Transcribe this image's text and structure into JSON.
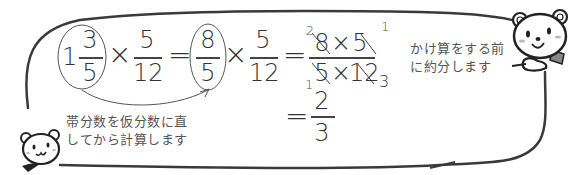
{
  "equation": {
    "mixed": {
      "whole": "1",
      "numerator": "3",
      "denominator": "5"
    },
    "times1": "×",
    "frac2": {
      "numerator": "5",
      "denominator": "12"
    },
    "eq1": "=",
    "improper": {
      "numerator": "8",
      "denominator": "5"
    },
    "times2": "×",
    "frac3": {
      "numerator": "5",
      "denominator": "12"
    },
    "eq2": "=",
    "combined": {
      "numerator": {
        "a": "8",
        "op": "×",
        "b": "5"
      },
      "denominator": {
        "a": "5",
        "op": "×",
        "b": "12"
      },
      "reduced": {
        "top_left": "2",
        "top_right": "1",
        "bottom_left": "1",
        "bottom_right": "3"
      }
    },
    "eq3": "=",
    "result": {
      "numerator": "2",
      "denominator": "3"
    }
  },
  "notes": {
    "reduce_first": [
      "かけ算をする前",
      "に約分します"
    ],
    "convert_mixed": [
      "帯分数を仮分数に直",
      "してから計算します"
    ]
  },
  "characters": {
    "top_right_bear": "bear-pointing",
    "bottom_left_bear": "bear-with-scarf"
  },
  "colors": {
    "line": "#3a3a3a",
    "text": "#333333",
    "note_text": "#555555",
    "background": "#ffffff"
  }
}
